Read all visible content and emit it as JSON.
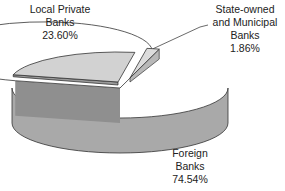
{
  "chart_data": {
    "type": "pie",
    "style": "3d-exploded",
    "title": "",
    "slices": [
      {
        "label_lines": [
          "Foreign",
          "Banks"
        ],
        "label": "Foreign Banks",
        "value": 74.54,
        "display": "74.54%",
        "color": "#ffffff",
        "side_color": "#a9a9a9",
        "exploded": false
      },
      {
        "label_lines": [
          "Local Private",
          "Banks"
        ],
        "label": "Local Private Banks",
        "value": 23.6,
        "display": "23.60%",
        "color": "#d2d2d2",
        "side_color": "#9a9a9a",
        "exploded": true
      },
      {
        "label_lines": [
          "State-owned",
          "and Municipal",
          "Banks"
        ],
        "label": "State-owned and Municipal Banks",
        "value": 1.86,
        "display": "1.86%",
        "color": "#dcdcdc",
        "side_color": "#b8b8b8",
        "exploded": true
      }
    ],
    "legend": "none",
    "label_placement": "outside"
  }
}
